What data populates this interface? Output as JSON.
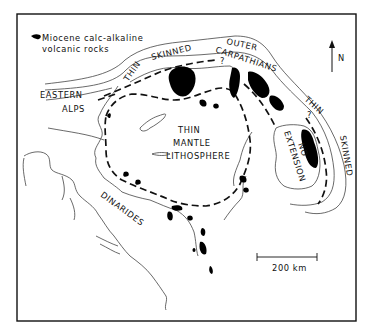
{
  "figure": {
    "legend": {
      "symbol": "black-blob",
      "line1": "Miocene calc-alkaline",
      "line2": "volcanic rocks"
    },
    "north_arrow": {
      "label": "N"
    },
    "scale_bar": {
      "label": "200 km"
    },
    "regions": {
      "eastern": "EASTERN",
      "alps": "ALPS",
      "thin_left": "THIN",
      "skinned_top": "SKINNED",
      "outer": "OUTER",
      "carpathians": "CARPATHIANS",
      "thin_right": "THIN",
      "skinned_right": "SKINNED",
      "thin_center": "THIN",
      "mantle": "MANTLE",
      "lithosphere": "LITHOSPHERE",
      "no": "NO",
      "extension": "EXTENSION",
      "dinarides": "DINARIDES",
      "question_1": "?",
      "question_2": "?"
    },
    "colors": {
      "ink": "#111111",
      "background": "#ffffff",
      "coast": "#444444"
    }
  }
}
